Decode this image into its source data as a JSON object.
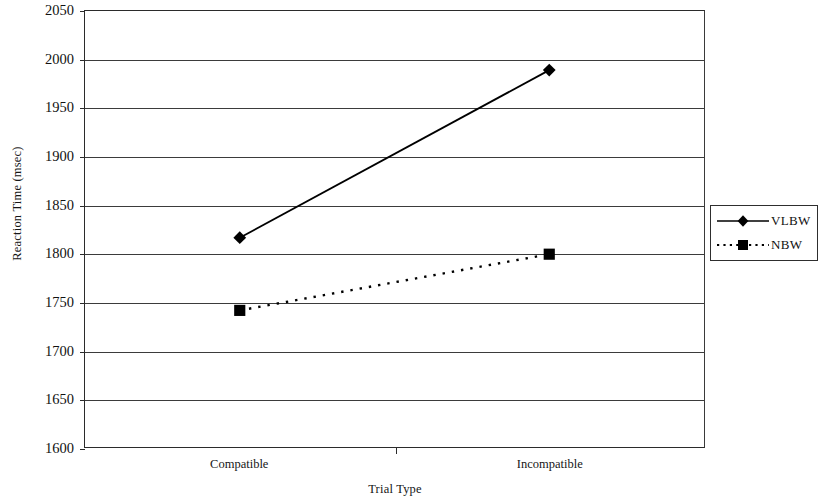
{
  "chart_data": {
    "type": "line",
    "title": "",
    "xlabel": "Trial Type",
    "ylabel": "Reaction Time (msec)",
    "categories": [
      "Compatible",
      "Incompatible"
    ],
    "ylim": [
      1600,
      2050
    ],
    "yticks": [
      1600,
      1650,
      1700,
      1750,
      1800,
      1850,
      1900,
      1950,
      2000,
      2050
    ],
    "ytick_labels": [
      "1600",
      "1650",
      "1700",
      "1750",
      "1800",
      "1850",
      "1900",
      "1950",
      "2000",
      "2050"
    ],
    "grid": true,
    "legend_position": "right",
    "series": [
      {
        "name": "VLBW",
        "values": [
          1816,
          1989
        ],
        "marker": "diamond",
        "linestyle": "solid",
        "color": "#000000"
      },
      {
        "name": "NBW",
        "values": [
          1741,
          1799
        ],
        "marker": "square",
        "linestyle": "dotted",
        "color": "#000000"
      }
    ]
  },
  "axes": {
    "y_title": "Reaction Time (msec)",
    "x_title": "Trial Type"
  },
  "legend": {
    "entries": [
      {
        "label": "VLBW",
        "marker": "diamond-marker",
        "line": "solid-line"
      },
      {
        "label": "NBW",
        "marker": "square-marker",
        "line": "dotted-line"
      }
    ]
  }
}
